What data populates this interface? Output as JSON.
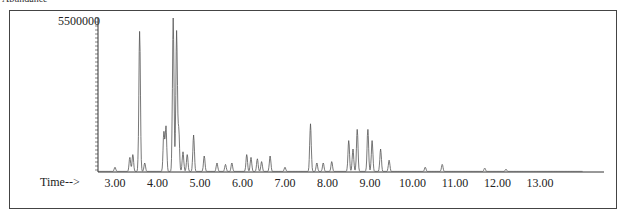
{
  "top_label": "Abundance",
  "y_axis": {
    "max_label": "5500000"
  },
  "x_axis": {
    "label": "Time-->",
    "ticks": [
      "3.00",
      "4.00",
      "5.00",
      "6.00",
      "7.00",
      "8.00",
      "9.00",
      "10.00",
      "11.00",
      "12.00",
      "13.00"
    ]
  },
  "chart_data": {
    "type": "line",
    "title": "",
    "xlabel": "Time-->",
    "ylabel": "Abundance",
    "xlim": [
      2.6,
      14.0
    ],
    "ylim": [
      0,
      5500000
    ],
    "x_ticks": [
      3,
      4,
      5,
      6,
      7,
      8,
      9,
      10,
      11,
      12,
      13
    ],
    "y_ticks": [
      5500000
    ],
    "grid": false,
    "legend": null,
    "peaks": [
      {
        "x": 3.0,
        "y": 150000
      },
      {
        "x": 3.35,
        "y": 500000
      },
      {
        "x": 3.42,
        "y": 600000
      },
      {
        "x": 3.58,
        "y": 5000000
      },
      {
        "x": 3.7,
        "y": 300000
      },
      {
        "x": 4.15,
        "y": 1400000
      },
      {
        "x": 4.2,
        "y": 1600000
      },
      {
        "x": 4.37,
        "y": 5500000
      },
      {
        "x": 4.45,
        "y": 5000000
      },
      {
        "x": 4.5,
        "y": 1500000
      },
      {
        "x": 4.6,
        "y": 700000
      },
      {
        "x": 4.7,
        "y": 600000
      },
      {
        "x": 4.85,
        "y": 1300000
      },
      {
        "x": 5.1,
        "y": 550000
      },
      {
        "x": 5.4,
        "y": 300000
      },
      {
        "x": 5.6,
        "y": 250000
      },
      {
        "x": 5.75,
        "y": 300000
      },
      {
        "x": 6.1,
        "y": 600000
      },
      {
        "x": 6.2,
        "y": 500000
      },
      {
        "x": 6.35,
        "y": 450000
      },
      {
        "x": 6.45,
        "y": 350000
      },
      {
        "x": 6.65,
        "y": 550000
      },
      {
        "x": 7.0,
        "y": 150000
      },
      {
        "x": 7.6,
        "y": 1700000
      },
      {
        "x": 7.75,
        "y": 300000
      },
      {
        "x": 7.9,
        "y": 300000
      },
      {
        "x": 8.1,
        "y": 350000
      },
      {
        "x": 8.5,
        "y": 1100000
      },
      {
        "x": 8.6,
        "y": 800000
      },
      {
        "x": 8.7,
        "y": 1500000
      },
      {
        "x": 8.95,
        "y": 1500000
      },
      {
        "x": 9.05,
        "y": 1100000
      },
      {
        "x": 9.25,
        "y": 800000
      },
      {
        "x": 9.45,
        "y": 400000
      },
      {
        "x": 10.3,
        "y": 150000
      },
      {
        "x": 10.7,
        "y": 250000
      },
      {
        "x": 11.7,
        "y": 120000
      },
      {
        "x": 12.2,
        "y": 80000
      }
    ]
  }
}
